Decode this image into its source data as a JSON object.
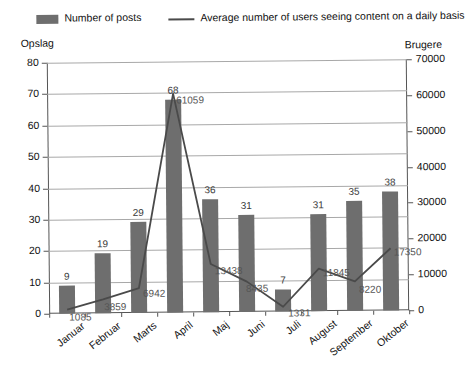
{
  "legend": {
    "bars_label": "Number of posts",
    "line_label": "Average number of users seeing content on a daily basis",
    "bars_swatch": "bar-swatch-icon",
    "line_swatch": "line-swatch-icon",
    "bar_color": "#6e6e6e",
    "line_color": "#4a4a4a"
  },
  "axis_titles": {
    "left": "Opslag",
    "right": "Brugere"
  },
  "chart_data": {
    "type": "bar",
    "title": "",
    "subtitle": "",
    "xlabel": "",
    "ylabel": "Opslag",
    "y2label": "Brugere",
    "grid": true,
    "legend_position": "top",
    "categories": [
      "Januar",
      "Februar",
      "Marts",
      "April",
      "Maj",
      "Juni",
      "Juli",
      "August",
      "September",
      "Oktober"
    ],
    "ylim": [
      0,
      80
    ],
    "yticks": [
      0,
      10,
      20,
      30,
      40,
      50,
      60,
      70,
      80
    ],
    "y2lim": [
      0,
      70000
    ],
    "y2ticks": [
      0,
      10000,
      20000,
      30000,
      40000,
      50000,
      60000,
      70000
    ],
    "series": [
      {
        "name": "Number of posts",
        "type": "bar",
        "axis": "left",
        "color": "#6e6e6e",
        "values": [
          9,
          19,
          29,
          68,
          36,
          31,
          7,
          31,
          35,
          38
        ]
      },
      {
        "name": "Average number of users seeing content on a daily basis",
        "type": "line",
        "axis": "right",
        "color": "#4a4a4a",
        "values": [
          1085,
          3859,
          6942,
          61059,
          13438,
          8435,
          1331,
          11845,
          8220,
          17350
        ]
      }
    ]
  }
}
